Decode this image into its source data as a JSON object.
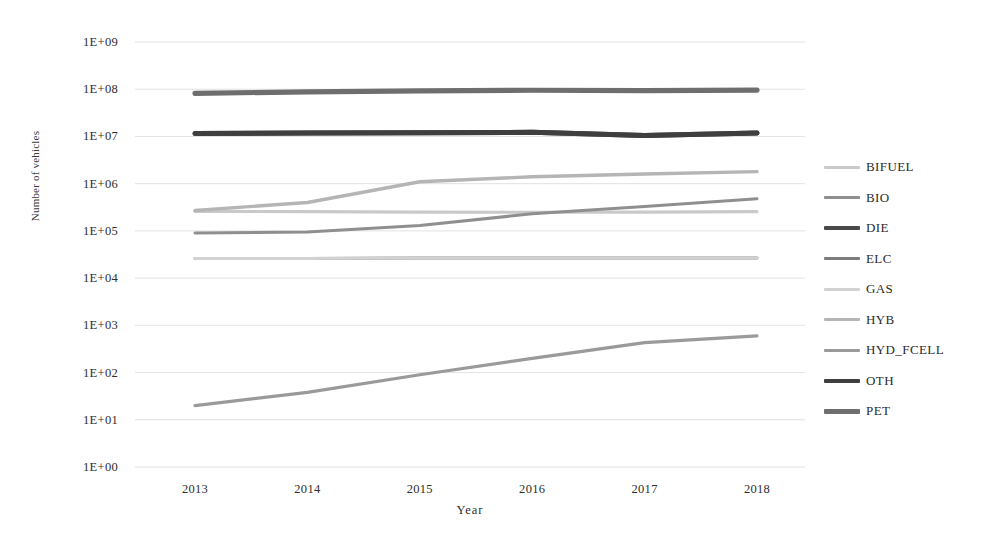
{
  "chart_data": {
    "type": "line",
    "title": "",
    "xlabel": "Year",
    "ylabel": "Number of vehicles",
    "x": [
      2013,
      2014,
      2015,
      2016,
      2017,
      2018
    ],
    "categories": [
      "2013",
      "2014",
      "2015",
      "2016",
      "2017",
      "2018"
    ],
    "y_scale": "log",
    "ylim": [
      1,
      1000000000
    ],
    "y_tick_labels": [
      "1E+09",
      "1E+08",
      "1E+07",
      "1E+06",
      "1E+05",
      "1E+04",
      "1E+03",
      "1E+02",
      "1E+01",
      "1E+00"
    ],
    "y_tick_values": [
      1000000000,
      100000000,
      10000000,
      1000000,
      100000,
      10000,
      1000,
      100,
      10,
      1
    ],
    "grid": true,
    "legend_position": "right",
    "series": [
      {
        "name": "BIFUEL",
        "color": "#c9c9c9",
        "width": 3.2,
        "values": [
          260000,
          255000,
          250000,
          248000,
          250000,
          255000
        ]
      },
      {
        "name": "BIO",
        "color": "#8f8f8f",
        "width": 3.0,
        "values": [
          90000,
          95000,
          130000,
          230000,
          330000,
          480000
        ]
      },
      {
        "name": "DIE",
        "color": "#4a4a4a",
        "width": 5.0,
        "values": [
          11500000,
          11800000,
          12000000,
          12200000,
          10500000,
          11800000
        ]
      },
      {
        "name": "ELC",
        "color": "#7d7d7d",
        "width": 3.0,
        "values": [
          26000,
          26000,
          26500,
          26500,
          26500,
          26500
        ]
      },
      {
        "name": "GAS",
        "color": "#d2d2d2",
        "width": 3.0,
        "values": [
          26000,
          26000,
          26500,
          26500,
          26500,
          26500
        ]
      },
      {
        "name": "HYB",
        "color": "#b5b5b5",
        "width": 3.4,
        "values": [
          270000,
          400000,
          1100000,
          1400000,
          1600000,
          1800000
        ]
      },
      {
        "name": "HYD_FCELL",
        "color": "#9a9a9a",
        "width": 3.2,
        "values": [
          20,
          38,
          90,
          200,
          430,
          600
        ]
      },
      {
        "name": "OTH",
        "color": "#3f3f3f",
        "width": 5.0,
        "values": [
          11500000,
          11800000,
          12000000,
          12200000,
          10500000,
          11800000
        ]
      },
      {
        "name": "PET",
        "color": "#6e6e6e",
        "width": 5.2,
        "values": [
          82000000,
          88000000,
          92000000,
          95000000,
          93000000,
          96000000
        ]
      }
    ]
  },
  "axes": {
    "y_title": "Number of vehicles",
    "x_title": "Year"
  }
}
